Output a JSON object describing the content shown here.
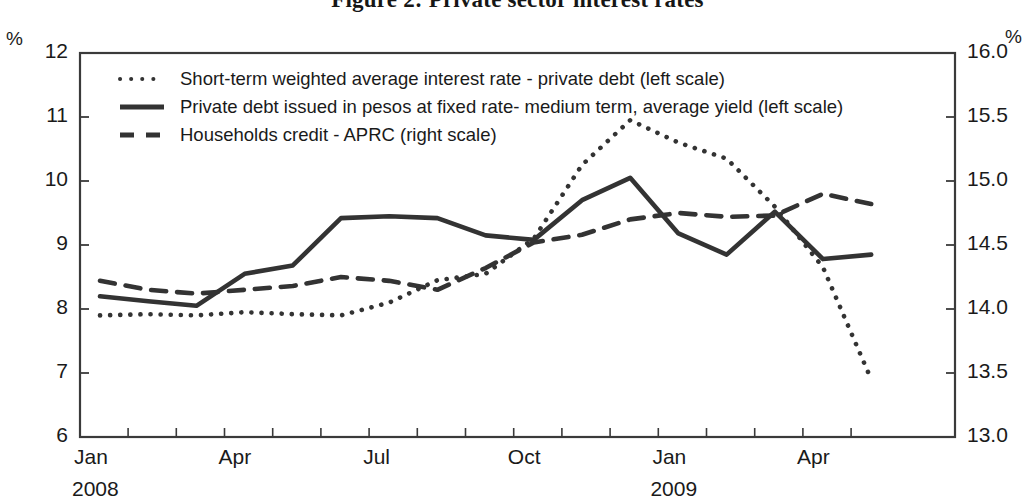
{
  "title": "Figure 2: Private sector interest rates",
  "units": {
    "left": "%",
    "right": "%"
  },
  "legend": [
    {
      "key": "short_term",
      "label": "Short-term weighted average interest rate - private debt (left scale)",
      "style": "dotted",
      "color": "#333333"
    },
    {
      "key": "private_debt",
      "label": "Private debt issued in pesos at fixed rate- medium term, average yield (left scale)",
      "style": "solid",
      "color": "#333333"
    },
    {
      "key": "households",
      "label": "Households credit - APRC (right scale)",
      "style": "dashed",
      "color": "#333333"
    }
  ],
  "chart_data": {
    "type": "line",
    "title": "Figure 2: Private sector interest rates",
    "xlabel": "",
    "ylabel": "%",
    "y2label": "%",
    "ylim": [
      6,
      12
    ],
    "y2lim": [
      13.0,
      16.0
    ],
    "yticks": [
      6,
      7,
      8,
      9,
      10,
      11,
      12
    ],
    "y2ticks": [
      13.0,
      13.5,
      14.0,
      14.5,
      15.0,
      15.5,
      16.0
    ],
    "grid": false,
    "legend_position": "top-left inside",
    "x": [
      "Jan 2008",
      "Feb 2008",
      "Mar 2008",
      "Apr 2008",
      "May 2008",
      "Jun 2008",
      "Jul 2008",
      "Aug 2008",
      "Sep 2008",
      "Oct 2008",
      "Nov 2008",
      "Dec 2008",
      "Jan 2009",
      "Feb 2009",
      "Mar 2009",
      "Apr 2009",
      "May 2009"
    ],
    "xtick_labels": [
      "Jan",
      "Apr",
      "Jul",
      "Oct",
      "Jan",
      "Apr"
    ],
    "xtick_years": [
      {
        "label": "2008",
        "at": "Jan 2008"
      },
      {
        "label": "2009",
        "at": "Jan 2009"
      }
    ],
    "series": [
      {
        "name": "Short-term weighted average interest rate - private debt (left scale)",
        "axis": "left",
        "style": "dotted",
        "values": [
          7.9,
          7.92,
          7.9,
          7.95,
          7.92,
          7.9,
          8.1,
          8.45,
          8.55,
          9.1,
          10.25,
          10.95,
          10.6,
          10.35,
          9.6,
          8.65,
          6.9
        ]
      },
      {
        "name": "Private debt issued in pesos at fixed rate- medium term, average yield (left scale)",
        "axis": "left",
        "style": "solid",
        "values": [
          8.2,
          8.12,
          8.05,
          8.55,
          8.68,
          9.42,
          9.45,
          9.42,
          9.15,
          9.08,
          9.7,
          10.05,
          9.18,
          8.85,
          9.52,
          8.78,
          8.85
        ]
      },
      {
        "name": "Households credit - APRC (right scale)",
        "axis": "right",
        "style": "dashed",
        "values": [
          14.22,
          14.15,
          14.12,
          14.15,
          14.18,
          14.25,
          14.22,
          14.15,
          14.32,
          14.52,
          14.58,
          14.7,
          14.75,
          14.72,
          14.73,
          14.9,
          14.82
        ]
      }
    ]
  }
}
